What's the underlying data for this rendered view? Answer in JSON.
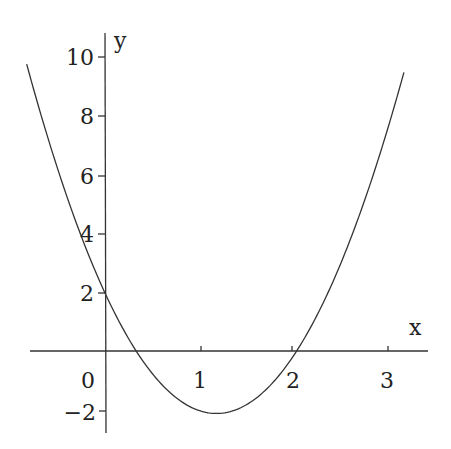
{
  "chart_data": {
    "type": "line",
    "title": "",
    "xlabel": "x",
    "ylabel": "y",
    "function": "y = 3x^2 - 7x + 2",
    "xlim": [
      -0.82,
      3.5
    ],
    "ylim": [
      -2.8,
      10.7
    ],
    "x_ticks": [
      1,
      2,
      3
    ],
    "x_tick_labels": [
      "0",
      "1",
      "2",
      "3"
    ],
    "y_ticks": [
      -2,
      2,
      4,
      6,
      8,
      10
    ],
    "y_tick_labels": [
      "−2",
      "2",
      "4",
      "6",
      "8",
      "10"
    ],
    "grid": false,
    "legend": null,
    "series": [
      {
        "name": "parabola",
        "x": [
          -0.82,
          -0.5,
          0,
          0.333,
          0.5,
          1,
          1.167,
          1.5,
          2,
          2.5,
          3,
          3.13
        ],
        "values": [
          9.76,
          6.25,
          2,
          0,
          -0.75,
          -2,
          -2.08,
          -1.75,
          0,
          3.25,
          8,
          9.48
        ]
      }
    ],
    "key_points": {
      "y_intercept": [
        0,
        2
      ],
      "roots": [
        0.333,
        2
      ],
      "vertex": [
        1.167,
        -2.083
      ]
    }
  },
  "labels": {
    "x_axis": "x",
    "y_axis": "y",
    "origin": "0",
    "x1": "1",
    "x2": "2",
    "x3": "3",
    "yneg2": "−2",
    "y2": "2",
    "y4": "4",
    "y6": "6",
    "y8": "8",
    "y10": "10"
  }
}
